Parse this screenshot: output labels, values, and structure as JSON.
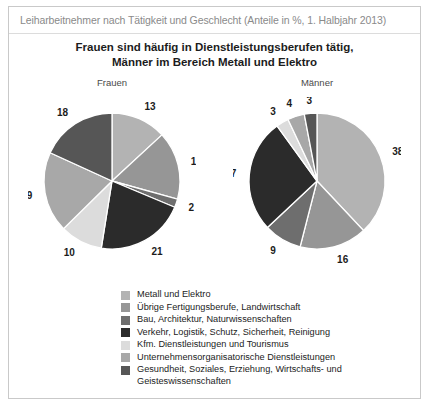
{
  "header": {
    "title": "Leiharbeitnehmer nach Tätigkeit und Geschlecht (Anteile in %, 1. Halbjahr 2013)"
  },
  "subtitle": {
    "line1": "Frauen sind häufig in Dienstleistungsberufen tätig,",
    "line2": "Männer im Bereich Metall und Elektro"
  },
  "panels": {
    "women_title": "Frauen",
    "men_title": "Männer"
  },
  "legend": [
    {
      "label": "Metall und Elektro",
      "color": "#b3b3b3"
    },
    {
      "label": "Übrige Fertigungsberufe, Landwirtschaft",
      "color": "#969696"
    },
    {
      "label": "Bau, Architektur, Naturwissenschaften",
      "color": "#6e6e6e"
    },
    {
      "label": "Verkehr, Logistik, Schutz, Sicherheit, Reinigung",
      "color": "#2b2b2b"
    },
    {
      "label": "Kfm. Dienstleistungen und Tourismus",
      "color": "#dcdcdc"
    },
    {
      "label": "Unternehmensorganisatorische Dienstleistungen",
      "color": "#a8a8a8"
    },
    {
      "label": "Gesundheit, Soziales, Erziehung, Wirtschafts- und Geisteswissenschaften",
      "color": "#565656"
    }
  ],
  "chart_data": [
    {
      "type": "pie",
      "title": "Frauen",
      "categories": [
        "Metall und Elektro",
        "Übrige Fertigungsberufe, Landwirtschaft",
        "Bau, Architektur, Naturwissenschaften",
        "Verkehr, Logistik, Schutz, Sicherheit, Reinigung",
        "Kfm. Dienstleistungen und Tourismus",
        "Unternehmensorganisatorische Dienstleistungen",
        "Gesundheit, Soziales, Erziehung, Wirtschafts- und Geisteswissenschaften"
      ],
      "values": [
        13,
        16,
        2,
        21,
        10,
        19,
        18
      ],
      "colors": [
        "#b3b3b3",
        "#969696",
        "#6e6e6e",
        "#2b2b2b",
        "#dcdcdc",
        "#a8a8a8",
        "#565656"
      ],
      "unit": "%",
      "start_angle": 0,
      "direction": "clockwise",
      "labels_outside": true
    },
    {
      "type": "pie",
      "title": "Männer",
      "categories": [
        "Metall und Elektro",
        "Übrige Fertigungsberufe, Landwirtschaft",
        "Bau, Architektur, Naturwissenschaften",
        "Verkehr, Logistik, Schutz, Sicherheit, Reinigung",
        "Kfm. Dienstleistungen und Tourismus",
        "Unternehmensorganisatorische Dienstleistungen",
        "Gesundheit, Soziales, Erziehung, Wirtschafts- und Geisteswissenschaften"
      ],
      "values": [
        38,
        16,
        9,
        27,
        3,
        4,
        3
      ],
      "colors": [
        "#b3b3b3",
        "#969696",
        "#6e6e6e",
        "#2b2b2b",
        "#dcdcdc",
        "#a8a8a8",
        "#565656"
      ],
      "unit": "%",
      "start_angle": 0,
      "direction": "clockwise",
      "labels_outside": true
    }
  ]
}
